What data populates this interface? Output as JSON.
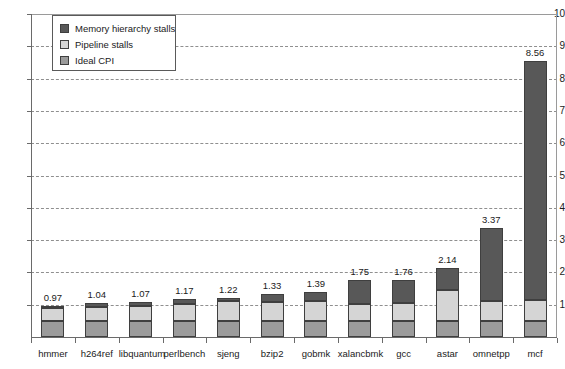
{
  "chart_data": {
    "type": "bar",
    "subtype": "stacked",
    "title": "",
    "xlabel": "",
    "ylabel": "",
    "ylim": [
      0,
      10
    ],
    "ytick_labels": [
      "1",
      "2",
      "3",
      "4",
      "5",
      "6",
      "7",
      "8",
      "9",
      "10"
    ],
    "ytick_values": [
      1,
      2,
      3,
      4,
      5,
      6,
      7,
      8,
      9,
      10
    ],
    "grid": true,
    "grid_style": "dashed-horizontal",
    "legend_position": "top-left-inside",
    "categories": [
      "hmmer",
      "h264ref",
      "libquantum",
      "perlbench",
      "sjeng",
      "bzip2",
      "gobmk",
      "xalancbmk",
      "gcc",
      "astar",
      "omnetpp",
      "mcf"
    ],
    "totals": [
      0.97,
      1.04,
      1.07,
      1.17,
      1.22,
      1.33,
      1.39,
      1.75,
      1.76,
      2.14,
      3.37,
      8.56
    ],
    "data_labels": [
      "0.97",
      "1.04",
      "1.07",
      "1.17",
      "1.22",
      "1.33",
      "1.39",
      "1.75",
      "1.76",
      "2.14",
      "3.37",
      "8.56"
    ],
    "series": [
      {
        "name": "Ideal CPI",
        "color": "#9b9b9b",
        "values": [
          0.5,
          0.5,
          0.5,
          0.5,
          0.5,
          0.5,
          0.5,
          0.5,
          0.5,
          0.5,
          0.5,
          0.5
        ]
      },
      {
        "name": "Pipeline stalls",
        "color": "#d5d5d5",
        "values": [
          0.41,
          0.42,
          0.45,
          0.53,
          0.6,
          0.58,
          0.62,
          0.53,
          0.54,
          0.95,
          0.6,
          0.65
        ]
      },
      {
        "name": "Memory hierarchy stalls",
        "color": "#585858",
        "values": [
          0.06,
          0.12,
          0.12,
          0.14,
          0.12,
          0.25,
          0.27,
          0.72,
          0.72,
          0.69,
          2.27,
          7.41
        ]
      }
    ]
  },
  "legend": {
    "items": [
      {
        "label": "Memory hierarchy stalls",
        "swatch": "memory-hierarchy-swatch",
        "color": "#585858"
      },
      {
        "label": "Pipeline stalls",
        "swatch": "pipeline-stalls-swatch",
        "color": "#d5d5d5"
      },
      {
        "label": "Ideal CPI",
        "swatch": "ideal-cpi-swatch",
        "color": "#9b9b9b"
      }
    ]
  }
}
